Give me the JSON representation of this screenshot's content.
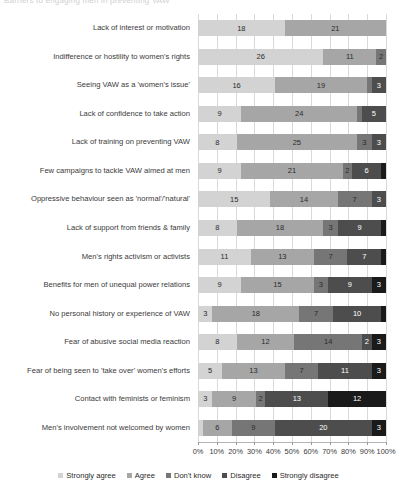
{
  "chart_title": "Barriers to engaging men in preventing VAW",
  "axis": {
    "x_ticks": [
      "0%",
      "10%",
      "20%",
      "30%",
      "40%",
      "50%",
      "60%",
      "70%",
      "80%",
      "90%",
      "100%"
    ],
    "xlim": [
      0,
      100
    ],
    "grid": true
  },
  "legend": {
    "position": "bottom",
    "items": [
      {
        "label": "Strongly agree",
        "color": "#d3d3d3"
      },
      {
        "label": "Agree",
        "color": "#a6a6a6"
      },
      {
        "label": "Don't know",
        "color": "#767676"
      },
      {
        "label": "Disagree",
        "color": "#4d4d4d"
      },
      {
        "label": "Strongly disagree",
        "color": "#1a1a1a"
      }
    ]
  },
  "chart_data": {
    "type": "bar",
    "orientation": "horizontal",
    "stacked": true,
    "normalized": true,
    "title": "Barriers to engaging men in preventing VAW",
    "xlabel": "",
    "ylabel": "",
    "xlim": [
      0,
      100
    ],
    "x_tick_labels": [
      "0%",
      "10%",
      "20%",
      "30%",
      "40%",
      "50%",
      "60%",
      "70%",
      "80%",
      "90%",
      "100%"
    ],
    "series": [
      {
        "name": "Strongly agree",
        "color": "#d3d3d3",
        "values": [
          18,
          26,
          16,
          9,
          8,
          9,
          15,
          8,
          11,
          9,
          3,
          8,
          5,
          3,
          1
        ]
      },
      {
        "name": "Agree",
        "color": "#a6a6a6",
        "values": [
          21,
          11,
          19,
          24,
          25,
          21,
          14,
          18,
          13,
          15,
          18,
          12,
          13,
          9,
          6
        ]
      },
      {
        "name": "Don't know",
        "color": "#767676",
        "values": [
          0,
          2,
          1,
          1,
          3,
          2,
          7,
          3,
          7,
          3,
          7,
          14,
          7,
          2,
          9
        ]
      },
      {
        "name": "Disagree",
        "color": "#4d4d4d",
        "values": [
          0,
          0,
          3,
          5,
          3,
          6,
          3,
          9,
          7,
          9,
          10,
          2,
          11,
          13,
          20
        ]
      },
      {
        "name": "Strongly disagree",
        "color": "#1a1a1a",
        "values": [
          0,
          0,
          0,
          0,
          0,
          1,
          0,
          1,
          1,
          3,
          1,
          3,
          3,
          12,
          3
        ]
      }
    ],
    "categories": [
      "Lack of interest or motivation",
      "Indifference or hostility to women's rights",
      "Seeing VAW as a 'women's issue'",
      "Lack of confidence to take action",
      "Lack of training on preventing VAW",
      "Few campaigns to tackle VAW aimed at men",
      "Oppressive behaviour seen as 'normal'/'natural'",
      "Lack of support from friends & family",
      "Men's rights activism or activists",
      "Benefits for men of unequal power relations",
      "No personal history or experience of VAW",
      "Fear of abusive social media reaction",
      "Fear of being seen to 'take over' women's efforts",
      "Contact with feminists or feminism",
      "Men's involvement not welcomed by women"
    ]
  }
}
